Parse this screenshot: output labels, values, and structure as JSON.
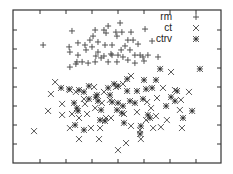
{
  "chart_data": {
    "type": "scatter",
    "title": "",
    "xlabel": "",
    "ylabel": "",
    "xlim": [
      0,
      8
    ],
    "ylim": [
      0,
      8
    ],
    "x_ticks": [
      1,
      2,
      3,
      4,
      5,
      6,
      7
    ],
    "y_ticks": [
      1,
      2,
      3,
      4,
      5,
      6,
      7
    ],
    "tick_labels_visible": false,
    "grid": false,
    "legend_position": "upper right",
    "series": [
      {
        "name": "rm",
        "marker": "plus",
        "points": [
          [
            1.12,
            6.21
          ],
          [
            2.23,
            6.95
          ],
          [
            2.12,
            6.11
          ],
          [
            2.15,
            5.84
          ],
          [
            2.46,
            6.32
          ],
          [
            2.73,
            6.21
          ],
          [
            3.04,
            6.68
          ],
          [
            3.12,
            7.0
          ],
          [
            2.92,
            6.47
          ],
          [
            3.23,
            6.37
          ],
          [
            3.54,
            6.84
          ],
          [
            3.46,
            7.0
          ],
          [
            3.62,
            7.21
          ],
          [
            4.08,
            7.37
          ],
          [
            3.92,
            6.89
          ],
          [
            4.15,
            6.89
          ],
          [
            4.5,
            6.89
          ],
          [
            3.96,
            6.68
          ],
          [
            4.38,
            6.47
          ],
          [
            4.58,
            6.47
          ],
          [
            4.77,
            6.26
          ],
          [
            5.04,
            7.05
          ],
          [
            5.31,
            6.42
          ],
          [
            2.46,
            5.68
          ],
          [
            2.77,
            5.95
          ],
          [
            3.0,
            6.11
          ],
          [
            3.23,
            5.84
          ],
          [
            3.5,
            6.21
          ],
          [
            3.77,
            6.21
          ],
          [
            3.46,
            5.63
          ],
          [
            3.77,
            5.68
          ],
          [
            4.0,
            5.68
          ],
          [
            4.12,
            5.95
          ],
          [
            4.46,
            5.95
          ],
          [
            4.65,
            5.68
          ],
          [
            4.85,
            5.68
          ],
          [
            4.96,
            5.58
          ],
          [
            5.15,
            5.68
          ],
          [
            5.54,
            5.58
          ],
          [
            2.42,
            5.32
          ],
          [
            2.62,
            5.32
          ],
          [
            2.85,
            5.26
          ],
          [
            3.12,
            5.32
          ],
          [
            3.35,
            5.53
          ],
          [
            3.62,
            5.32
          ],
          [
            3.96,
            5.32
          ],
          [
            4.19,
            5.58
          ],
          [
            4.38,
            5.42
          ],
          [
            4.65,
            5.26
          ],
          [
            5.0,
            5.37
          ],
          [
            2.15,
            5.05
          ],
          [
            2.38,
            5.21
          ],
          [
            3.73,
            5.74
          ],
          [
            3.15,
            5.63
          ],
          [
            4.27,
            6.16
          ]
        ]
      },
      {
        "name": "ct",
        "marker": "cross",
        "points": [
          [
            1.58,
            4.26
          ],
          [
            1.42,
            3.63
          ],
          [
            1.31,
            2.74
          ],
          [
            1.85,
            3.11
          ],
          [
            2.15,
            3.84
          ],
          [
            2.38,
            3.74
          ],
          [
            1.85,
            2.53
          ],
          [
            2.15,
            1.84
          ],
          [
            2.23,
            2.58
          ],
          [
            2.5,
            1.26
          ],
          [
            2.96,
            1.84
          ],
          [
            3.27,
            1.26
          ],
          [
            2.81,
            2.58
          ],
          [
            3.12,
            2.89
          ],
          [
            3.08,
            4.0
          ],
          [
            3.46,
            3.74
          ],
          [
            3.69,
            3.32
          ],
          [
            3.92,
            4.0
          ],
          [
            4.5,
            4.58
          ],
          [
            4.0,
            0.68
          ],
          [
            4.23,
            2.58
          ],
          [
            4.31,
            1.05
          ],
          [
            4.73,
            2.68
          ],
          [
            4.88,
            1.26
          ],
          [
            4.85,
            1.74
          ],
          [
            5.35,
            1.84
          ],
          [
            6.04,
            4.79
          ],
          [
            5.73,
            3.95
          ],
          [
            5.5,
            3.42
          ],
          [
            6.19,
            3.84
          ],
          [
            6.38,
            2.79
          ],
          [
            6.42,
            3.32
          ],
          [
            6.46,
            1.84
          ],
          [
            0.77,
            1.68
          ],
          [
            2.69,
            3.37
          ],
          [
            3.38,
            3.16
          ],
          [
            5.12,
            3.21
          ],
          [
            5.08,
            2.26
          ],
          [
            5.88,
            2.26
          ],
          [
            5.46,
            2.47
          ],
          [
            5.65,
            1.89
          ],
          [
            6.73,
            3.74
          ],
          [
            4.19,
            4.16
          ],
          [
            3.73,
            2.37
          ],
          [
            4.5,
            1.95
          ],
          [
            3.31,
            1.84
          ],
          [
            3.54,
            2.37
          ],
          [
            5.27,
            2.89
          ],
          [
            2.73,
            3.11
          ],
          [
            2.5,
            2.37
          ]
        ]
      },
      {
        "name": "ctrv",
        "marker": "star",
        "points": [
          [
            1.81,
            3.95
          ],
          [
            2.12,
            3.89
          ],
          [
            2.5,
            3.84
          ],
          [
            2.69,
            3.74
          ],
          [
            2.88,
            4.05
          ],
          [
            3.19,
            3.58
          ],
          [
            3.23,
            3.26
          ],
          [
            3.62,
            3.95
          ],
          [
            3.85,
            4.16
          ],
          [
            4.0,
            4.05
          ],
          [
            4.35,
            4.42
          ],
          [
            4.35,
            3.79
          ],
          [
            4.73,
            3.79
          ],
          [
            5.0,
            4.37
          ],
          [
            4.96,
            3.37
          ],
          [
            5.08,
            3.89
          ],
          [
            5.31,
            3.95
          ],
          [
            5.46,
            4.37
          ],
          [
            5.62,
            4.95
          ],
          [
            6.27,
            3.79
          ],
          [
            5.85,
            3.0
          ],
          [
            6.04,
            3.47
          ],
          [
            6.19,
            3.26
          ],
          [
            6.85,
            2.74
          ],
          [
            7.15,
            4.95
          ],
          [
            6.5,
            2.37
          ],
          [
            2.31,
            3.16
          ],
          [
            2.42,
            2.89
          ],
          [
            2.46,
            2.74
          ],
          [
            2.35,
            2.0
          ],
          [
            2.69,
            1.74
          ],
          [
            3.31,
            2.26
          ],
          [
            3.5,
            2.21
          ],
          [
            3.69,
            3.58
          ],
          [
            3.77,
            3.21
          ],
          [
            4.0,
            3.16
          ],
          [
            4.19,
            3.0
          ],
          [
            4.15,
            2.63
          ],
          [
            4.46,
            3.26
          ],
          [
            4.65,
            3.16
          ],
          [
            4.88,
            1.95
          ],
          [
            5.23,
            2.37
          ],
          [
            5.15,
            2.53
          ],
          [
            4.85,
            1.53
          ],
          [
            4.23,
            2.11
          ],
          [
            3.96,
            2.79
          ],
          [
            3.35,
            2.79
          ],
          [
            2.88,
            3.37
          ],
          [
            3.15,
            3.47
          ]
        ]
      }
    ]
  },
  "legend": {
    "items": [
      {
        "label": "rm",
        "marker": "plus"
      },
      {
        "label": "ct",
        "marker": "cross"
      },
      {
        "label": "ctrv",
        "marker": "star"
      }
    ]
  },
  "style": {
    "marker_color": "#444444",
    "frame_color": "#333333",
    "background": "#ffffff"
  }
}
